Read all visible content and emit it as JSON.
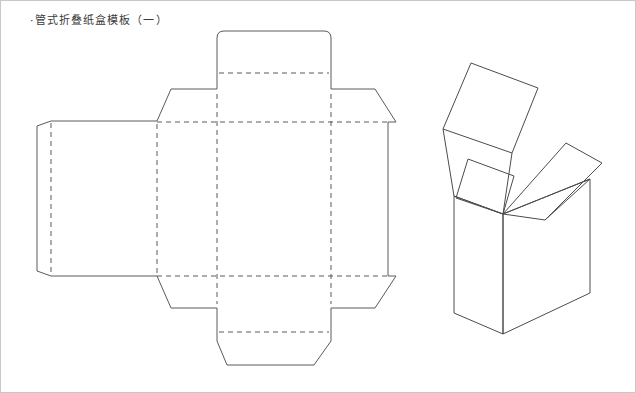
{
  "page": {
    "title": "·管式折叠纸盒模板（一）",
    "background_color": "#ffffff",
    "border_color": "#c8c8c8",
    "width": 636,
    "height": 393
  },
  "style": {
    "cut_line_color": "#5a5a5a",
    "fold_line_color": "#5a5a5a",
    "box_line_color": "#4c4c4c",
    "fold_dash_pattern": "5 4"
  },
  "dieline": {
    "name": "tuck-end-folding-carton-dieline",
    "outline_path": "M 36 125 L 50 120 L 156 120 L 170 88 L 216 88 L 216 37 Q 216 30 223 30 L 323 30 Q 330 30 330 37 L 330 88 L 374 88 L 395 121 L 387 121 L 387 275 L 395 275 L 374 307 L 330 307 L 330 340 L 313 364 L 226 364 L 216 340 L 216 307 L 170 307 L 156 275 L 50 275 L 36 270 Z",
    "fold_lines": [
      {
        "name": "glue-flap-fold",
        "path": "M 50 122 L 50 273"
      },
      {
        "name": "panel-1-fold",
        "path": "M 156 123 L 156 272"
      },
      {
        "name": "panel-2-fold",
        "path": "M 216 93 L 216 303"
      },
      {
        "name": "panel-3-fold",
        "path": "M 330 93 L 330 303"
      },
      {
        "name": "top-horizontal-score",
        "path": "M 156 121 L 390 121"
      },
      {
        "name": "bottom-horizontal-score",
        "path": "M 156 275 L 390 275"
      },
      {
        "name": "top-tuck-fold",
        "path": "M 218 72 L 328 72"
      },
      {
        "name": "bottom-tuck-fold",
        "path": "M 218 331 L 328 331"
      }
    ],
    "panels": [
      {
        "name": "glue-flap",
        "label": ""
      },
      {
        "name": "back-panel",
        "label": ""
      },
      {
        "name": "side-panel-left",
        "label": ""
      },
      {
        "name": "front-panel",
        "label": ""
      },
      {
        "name": "side-panel-right",
        "label": ""
      },
      {
        "name": "top-tuck-flap",
        "label": ""
      },
      {
        "name": "bottom-tuck-flap",
        "label": ""
      },
      {
        "name": "top-dust-flap-left",
        "label": ""
      },
      {
        "name": "top-dust-flap-right",
        "label": ""
      },
      {
        "name": "bottom-dust-flap-left",
        "label": ""
      },
      {
        "name": "bottom-dust-flap-right",
        "label": ""
      }
    ]
  },
  "assembled_box": {
    "name": "assembled-carton-3d-view",
    "paths": [
      {
        "name": "box-front-left-face",
        "d": "M 453 195 L 453 312 L 502 333 L 502 213 Z"
      },
      {
        "name": "box-front-right-face",
        "d": "M 502 213 L 502 333 L 589 292 L 589 178 Z"
      },
      {
        "name": "box-top-left-edge",
        "d": "M 453 195 L 502 213"
      },
      {
        "name": "box-top-right-edge",
        "d": "M 502 213 L 589 178"
      },
      {
        "name": "back-lid-flap",
        "d": "M 442 128 L 470 62 L 537 87 L 511 152 Z"
      },
      {
        "name": "back-lid-hinge-left",
        "d": "M 442 128 L 453 195"
      },
      {
        "name": "back-lid-hinge-right",
        "d": "M 511 152 L 502 213"
      },
      {
        "name": "right-dust-flap",
        "d": "M 502 213 L 565 142 L 601 162 L 544 219 Z"
      },
      {
        "name": "right-flap-edge",
        "d": "M 544 219 L 589 178"
      },
      {
        "name": "front-dust-flap",
        "d": "M 502 213 L 513 175 L 467 158 L 455 197 Z"
      },
      {
        "name": "front-flap-fold",
        "d": "M 455 197 L 502 213"
      }
    ]
  }
}
